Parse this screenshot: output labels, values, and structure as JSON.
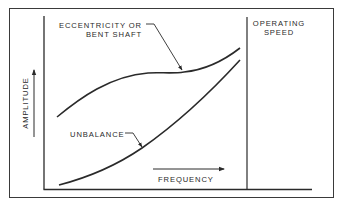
{
  "diagram": {
    "type": "vibration amplitude vs frequency",
    "labels": {
      "eccentricity_line1": "ECCENTRICITY OR",
      "eccentricity_line2": "BENT SHAFT",
      "operating_line1": "OPERATING",
      "operating_line2": "SPEED",
      "unbalance": "UNBALANCE",
      "xaxis": "FREQUENCY",
      "yaxis": "AMPLITUDE"
    },
    "curves": [
      {
        "name": "Eccentricity or bent shaft",
        "shape": "rises, plateaus mid-frequency, rises again toward operating speed"
      },
      {
        "name": "Unbalance",
        "shape": "monotonically increasing, steepening toward operating speed"
      }
    ],
    "markers": [
      {
        "name": "Operating speed",
        "type": "vertical line"
      }
    ],
    "colors": {
      "ink": "#2a2a2a",
      "background": "#ffffff"
    }
  }
}
